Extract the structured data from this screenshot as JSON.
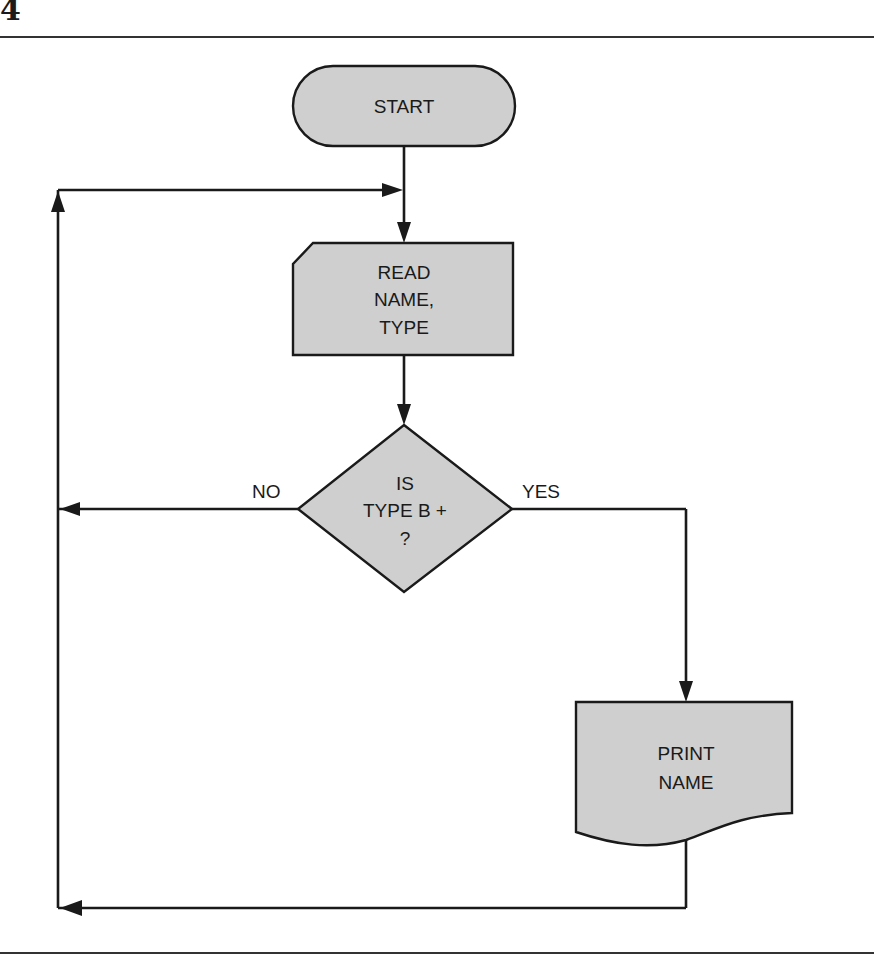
{
  "page": {
    "number": "4"
  },
  "flowchart": {
    "nodes": {
      "start": {
        "type": "terminal",
        "lines": [
          "START"
        ]
      },
      "read": {
        "type": "input-card",
        "lines": [
          "READ",
          "NAME,",
          "TYPE"
        ]
      },
      "decision": {
        "type": "decision",
        "lines": [
          "IS",
          "TYPE B +",
          "?"
        ]
      },
      "print": {
        "type": "document",
        "lines": [
          "PRINT",
          "NAME"
        ]
      }
    },
    "edges": {
      "no_label": "NO",
      "yes_label": "YES"
    }
  },
  "colors": {
    "shape_fill": "#cfcfcf",
    "stroke": "#1a1a1a"
  }
}
